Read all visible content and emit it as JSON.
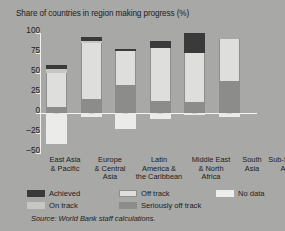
{
  "chart_data": {
    "type": "bar",
    "title": "Share of countries in region making progress (%)",
    "xlabel": "",
    "ylabel": "",
    "ylim": [
      -50,
      100
    ],
    "yticks": [
      100,
      75,
      50,
      25,
      0,
      -25,
      -50
    ],
    "ytick_labels": [
      "100",
      "75",
      "50",
      "25",
      "0",
      "–25",
      "–50"
    ],
    "grid": false,
    "legend_position": "bottom",
    "stacked": true,
    "categories": [
      "East Asia & Pacific",
      "Europe & Central Asia",
      "Latin America & the Caribbean",
      "Middle East & North Africa",
      "South Asia",
      "Sub-Saharan Africa"
    ],
    "series": [
      {
        "name": "Achieved",
        "color": "#3a3a3a",
        "values": [
          5,
          5,
          3,
          8,
          24,
          0
        ]
      },
      {
        "name": "On track",
        "color": "#c6c6c4",
        "values": [
          6,
          2,
          0,
          0,
          0,
          0
        ]
      },
      {
        "name": "Off track",
        "color": "#dededc",
        "values": [
          42,
          70,
          42,
          67,
          62,
          53
        ]
      },
      {
        "name": "Seriously off track",
        "color": "#8c8c8a",
        "values": [
          8,
          18,
          36,
          15,
          14,
          40
        ]
      },
      {
        "name": "No data",
        "color": "#ebebe9",
        "values": [
          -38,
          -5,
          -20,
          -7,
          -2,
          -4
        ]
      }
    ],
    "totals_positive": [
      61,
      95,
      81,
      90,
      100,
      93
    ],
    "source": "Source: World Bank staff calculations."
  },
  "axis": {
    "tick_100": "100",
    "tick_75": "75",
    "tick_50": "50",
    "tick_25": "25",
    "tick_0": "0",
    "tick_m25": "–25",
    "tick_m50": "–50"
  },
  "categories_lines": [
    [
      "East Asia",
      "& Pacific"
    ],
    [
      "Europe",
      "& Central",
      "Asia"
    ],
    [
      "Latin",
      "America &",
      "the Caribbean"
    ],
    [
      "Middle East",
      "& North",
      "Africa"
    ],
    [
      "South",
      "Asia"
    ],
    [
      "Sub-Saharan",
      "Africa"
    ]
  ],
  "legend": {
    "achieved": "Achieved",
    "on_track": "On track",
    "off_track": "Off track",
    "seriously_off_track": "Seriously off track",
    "no_data": "No data"
  }
}
